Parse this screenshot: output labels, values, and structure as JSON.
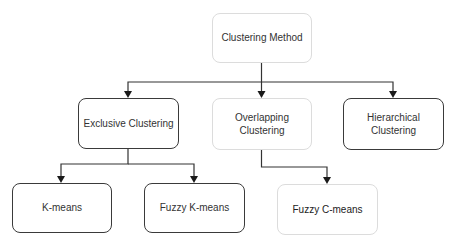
{
  "diagram": {
    "type": "tree",
    "nodes": [
      {
        "id": "root",
        "label": "Clustering Method",
        "style": "faint"
      },
      {
        "id": "exclusive",
        "label": "Exclusive Clustering",
        "style": "solid"
      },
      {
        "id": "overlapping",
        "label": "Overlapping Clustering",
        "style": "faint"
      },
      {
        "id": "hierarchical",
        "label": "Hierarchical Clustering",
        "style": "solid"
      },
      {
        "id": "kmeans",
        "label": "K-means",
        "style": "solid"
      },
      {
        "id": "fuzzykmeans",
        "label": "Fuzzy K-means",
        "style": "solid"
      },
      {
        "id": "fuzzycmeans",
        "label": "Fuzzy C-means",
        "style": "faint"
      }
    ],
    "edges": [
      {
        "from": "root",
        "to": "exclusive"
      },
      {
        "from": "root",
        "to": "overlapping"
      },
      {
        "from": "root",
        "to": "hierarchical"
      },
      {
        "from": "exclusive",
        "to": "kmeans"
      },
      {
        "from": "exclusive",
        "to": "fuzzykmeans"
      },
      {
        "from": "overlapping",
        "to": "fuzzycmeans"
      }
    ]
  },
  "labels": {
    "root": "Clustering Method",
    "exclusive": "Exclusive Clustering",
    "overlapping_line1": "Overlapping",
    "overlapping_line2": "Clustering",
    "hierarchical_line1": "Hierarchical",
    "hierarchical_line2": "Clustering",
    "kmeans": "K-means",
    "fuzzykmeans": "Fuzzy K-means",
    "fuzzycmeans": "Fuzzy C-means"
  }
}
